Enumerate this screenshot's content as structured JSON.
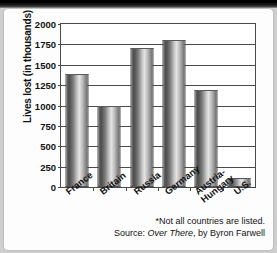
{
  "chart_data": {
    "type": "bar",
    "title": "",
    "xlabel": "",
    "ylabel": "Lives lost (in thousands)",
    "categories": [
      "France",
      "Britain",
      "Russia",
      "Germany",
      "Austria-\nHungary",
      "U.S."
    ],
    "values": [
      1390,
      1000,
      1700,
      1800,
      1190,
      115
    ],
    "ylim": [
      0,
      2000
    ],
    "yticks": [
      0,
      250,
      500,
      750,
      1000,
      1250,
      1500,
      1750,
      2000
    ],
    "ytick_labels": [
      "0",
      "250",
      "500",
      "750",
      "1000",
      "1250",
      "1500",
      "1750",
      "2000"
    ],
    "grid": true,
    "legend": "none",
    "series_color": "#8d8d8d",
    "axis_color": "#4a4a4a",
    "annotations": [
      "*Not all countries are listed.",
      "Source: Over There, by Byron Farwell"
    ]
  },
  "notes": {
    "footnote": "*Not all countries are listed.",
    "source_prefix": "Source: ",
    "source_title": "Over There",
    "source_suffix": ", by Byron Farwell"
  }
}
